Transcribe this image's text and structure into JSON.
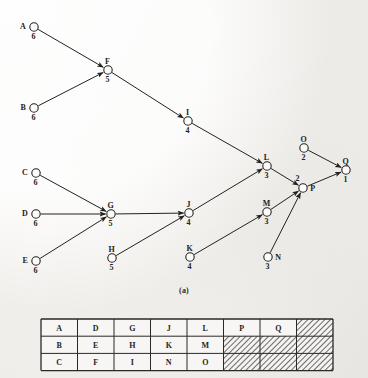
{
  "figure": {
    "caption": "(a)",
    "type": "activity-on-node-network-diagram",
    "nodes": [
      {
        "id": "A",
        "label": "A",
        "weight": "6",
        "x": 34,
        "y": 27,
        "label_pos": "left",
        "weight_pos": "below"
      },
      {
        "id": "B",
        "label": "B",
        "weight": "6",
        "x": 34,
        "y": 108,
        "label_pos": "left",
        "weight_pos": "below"
      },
      {
        "id": "C",
        "label": "C",
        "weight": "6",
        "x": 36,
        "y": 173,
        "label_pos": "left",
        "weight_pos": "below"
      },
      {
        "id": "D",
        "label": "D",
        "weight": "6",
        "x": 36,
        "y": 214,
        "label_pos": "left",
        "weight_pos": "below"
      },
      {
        "id": "E",
        "label": "E",
        "weight": "6",
        "x": 36,
        "y": 261,
        "label_pos": "left",
        "weight_pos": "below"
      },
      {
        "id": "F",
        "label": "F",
        "weight": "5",
        "x": 108,
        "y": 70,
        "label_pos": "above",
        "weight_pos": "below"
      },
      {
        "id": "G",
        "label": "G",
        "weight": "5",
        "x": 111,
        "y": 214,
        "label_pos": "above",
        "weight_pos": "below"
      },
      {
        "id": "H",
        "label": "H",
        "weight": "5",
        "x": 112,
        "y": 258,
        "label_pos": "above",
        "weight_pos": "below"
      },
      {
        "id": "I",
        "label": "I",
        "weight": "4",
        "x": 188,
        "y": 121,
        "label_pos": "above",
        "weight_pos": "below"
      },
      {
        "id": "J",
        "label": "J",
        "weight": "4",
        "x": 189,
        "y": 213,
        "label_pos": "above",
        "weight_pos": "below"
      },
      {
        "id": "K",
        "label": "K",
        "weight": "4",
        "x": 190,
        "y": 257,
        "label_pos": "above",
        "weight_pos": "below"
      },
      {
        "id": "L",
        "label": "L",
        "weight": "3",
        "x": 267,
        "y": 166,
        "label_pos": "above",
        "weight_pos": "below"
      },
      {
        "id": "M",
        "label": "M",
        "weight": "3",
        "x": 267,
        "y": 212,
        "label_pos": "above",
        "weight_pos": "below"
      },
      {
        "id": "N",
        "label": "N",
        "weight": "3",
        "x": 268,
        "y": 257,
        "label_pos": "right",
        "weight_pos": "below"
      },
      {
        "id": "O",
        "label": "O",
        "weight": "2",
        "x": 304,
        "y": 148,
        "label_pos": "above",
        "weight_pos": "below"
      },
      {
        "id": "P",
        "label": "P",
        "weight": "2",
        "x": 303,
        "y": 188,
        "label_pos": "right",
        "weight_pos": "above"
      },
      {
        "id": "Q",
        "label": "Q",
        "weight": "1",
        "x": 346,
        "y": 170,
        "label_pos": "above",
        "weight_pos": "below"
      }
    ],
    "edges": [
      {
        "from": "A",
        "to": "F"
      },
      {
        "from": "B",
        "to": "F"
      },
      {
        "from": "F",
        "to": "I"
      },
      {
        "from": "I",
        "to": "L"
      },
      {
        "from": "C",
        "to": "G"
      },
      {
        "from": "D",
        "to": "G"
      },
      {
        "from": "E",
        "to": "G"
      },
      {
        "from": "G",
        "to": "J"
      },
      {
        "from": "H",
        "to": "J"
      },
      {
        "from": "J",
        "to": "L"
      },
      {
        "from": "K",
        "to": "M"
      },
      {
        "from": "L",
        "to": "P"
      },
      {
        "from": "M",
        "to": "P"
      },
      {
        "from": "N",
        "to": "P"
      },
      {
        "from": "O",
        "to": "Q"
      },
      {
        "from": "P",
        "to": "Q"
      }
    ]
  },
  "table": {
    "rows": [
      [
        "A",
        "D",
        "G",
        "J",
        "L",
        "P",
        "Q",
        ""
      ],
      [
        "B",
        "E",
        "H",
        "K",
        "M",
        "",
        "",
        ""
      ],
      [
        "C",
        "F",
        "I",
        "N",
        "O",
        "",
        "",
        ""
      ]
    ],
    "hatched": [
      [
        false,
        false,
        false,
        false,
        false,
        false,
        false,
        true
      ],
      [
        false,
        false,
        false,
        false,
        false,
        true,
        true,
        true
      ],
      [
        false,
        false,
        false,
        false,
        false,
        true,
        true,
        true
      ]
    ]
  },
  "colors": {
    "ink": "#242220",
    "paper": "#f4f3f1",
    "rule": "#2b2927",
    "hatch": "#4a4744"
  }
}
